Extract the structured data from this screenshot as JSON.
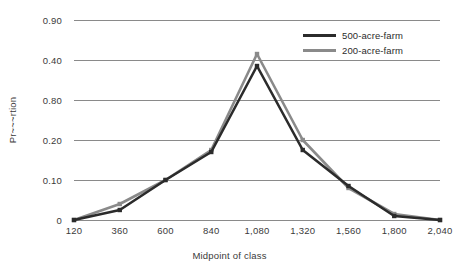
{
  "chart_data": {
    "type": "line",
    "title": "",
    "xlabel": "Midpoint of class",
    "ylabel": "Proportion",
    "x": [
      120,
      360,
      600,
      840,
      1080,
      1320,
      1560,
      1800,
      2040
    ],
    "categories": [
      "120",
      "360",
      "600",
      "840",
      "1,080",
      "1,320",
      "1,560",
      "1,800",
      "2,040"
    ],
    "y_tick_labels": [
      "0.90",
      "0.40",
      "0.80",
      "0.20",
      "0.10",
      "0"
    ],
    "ylim": [
      0,
      0.5
    ],
    "grid": true,
    "legend_position": "top-right",
    "series": [
      {
        "name": "500-acre-farm",
        "color": "#2b2b2b",
        "values": [
          0,
          0.025,
          0.1,
          0.17,
          0.385,
          0.175,
          0.085,
          0.01,
          0
        ]
      },
      {
        "name": "200-acre-farm",
        "color": "#8a8a8a",
        "values": [
          0,
          0.04,
          0.1,
          0.175,
          0.415,
          0.2,
          0.08,
          0.015,
          0
        ]
      }
    ]
  },
  "axes": {
    "y_title": "Pr~~~rtion",
    "x_title": "Midpoint of class",
    "y_ticks": [
      "0.90",
      "0.40",
      "0.80",
      "0.20",
      "0.10",
      "0"
    ],
    "x_ticks": [
      "120",
      "360",
      "600",
      "840",
      "1,080",
      "1,320",
      "1,560",
      "1,800",
      "2,040"
    ]
  },
  "legend": {
    "items": [
      {
        "label": "500-acre-farm",
        "color": "#2b2b2b"
      },
      {
        "label": "200-acre-farm",
        "color": "#8a8a8a"
      }
    ]
  },
  "colors": {
    "background": "#ffffff",
    "gridline": "#8a8a8a",
    "text": "#3a3a3a",
    "series_dark": "#2b2b2b",
    "series_gray": "#8a8a8a"
  }
}
